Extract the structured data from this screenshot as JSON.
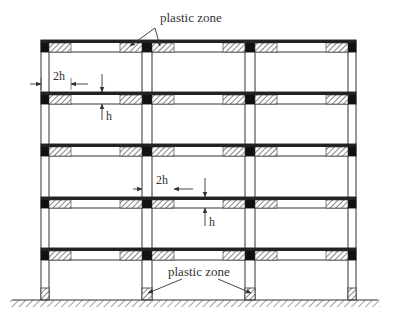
{
  "diagram": {
    "type": "multi-storey reinforced concrete frame elevation",
    "bays": 3,
    "storeys": 5,
    "labels": {
      "plastic_zone_top": "plastic zone",
      "plastic_zone_bottom": "plastic zone",
      "dim_2h_top": "2h",
      "dim_h_top": "h",
      "dim_2h_mid": "2h",
      "dim_h_mid": "h"
    },
    "colors": {
      "line": "#333333",
      "joint": "#111111",
      "hatch": "#444444",
      "background": "#ffffff"
    },
    "geometry": {
      "columns_x": [
        [
          41,
          49
        ],
        [
          142,
          152
        ],
        [
          245,
          255
        ],
        [
          348,
          356
        ]
      ],
      "floor_beams_y": [
        [
          40,
          52
        ],
        [
          92,
          104
        ],
        [
          144,
          156
        ],
        [
          197,
          208
        ],
        [
          248,
          260
        ]
      ],
      "ground_y": 300,
      "ground_x": [
        12,
        378
      ],
      "base_hinge_y": [
        288,
        300
      ]
    }
  }
}
